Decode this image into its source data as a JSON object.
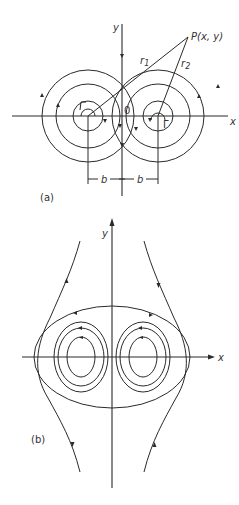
{
  "figure": {
    "panel_a": {
      "caption": "(a)",
      "axis_x_label": "x",
      "axis_y_label": "y",
      "origin_label": "0",
      "point_label": "P(x, y)",
      "r1_label": "r",
      "r1_sub": "1",
      "r2_label": "r",
      "r2_sub": "2",
      "circulation_label": "Γ",
      "b_left_label": "b",
      "b_right_label": "b",
      "description": "Two counter-rotating line vortices located at x = -b and x = +b, with circular streamlines around each and distances r1, r2 from each vortex to point P(x, y)"
    },
    "panel_b": {
      "caption": "(b)",
      "axis_x_label": "x",
      "axis_y_label": "y",
      "description": "Streamline pattern of a vortex pair in a uniform stream: closed loops around each vortex, an oval enclosing both, and open streamlines outside"
    },
    "colors": {
      "line": "#2a2a2a",
      "background": "#ffffff"
    }
  }
}
